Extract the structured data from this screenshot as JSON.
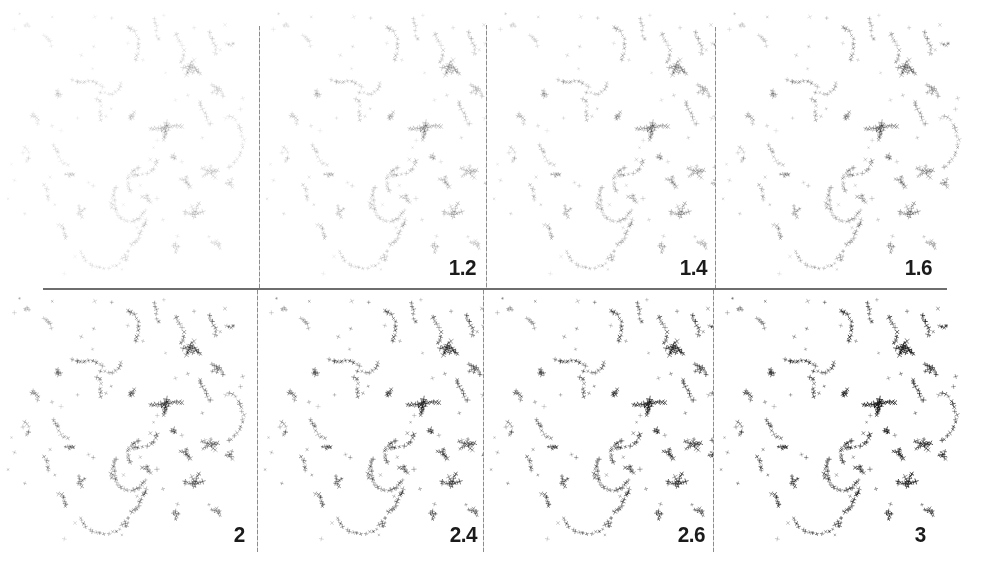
{
  "figure": {
    "type": "scanned-halftone-panel-grid",
    "rows": 2,
    "cols": 4
  },
  "panels": [
    {
      "label": "",
      "value": 1.0,
      "intensity": 0.14
    },
    {
      "label": "1.2",
      "value": 1.2,
      "intensity": 0.21
    },
    {
      "label": "1.4",
      "value": 1.4,
      "intensity": 0.28
    },
    {
      "label": "1.6",
      "value": 1.6,
      "intensity": 0.35
    },
    {
      "label": "2",
      "value": 2.0,
      "intensity": 0.48
    },
    {
      "label": "2.4",
      "value": 2.4,
      "intensity": 0.6
    },
    {
      "label": "2.6",
      "value": 2.6,
      "intensity": 0.68
    },
    {
      "label": "3",
      "value": 3.0,
      "intensity": 0.82
    }
  ],
  "colors": {
    "background": "#ffffff",
    "ink": "#161616",
    "label": "#1b1b1b",
    "column_divider": "#8c8c8c",
    "row_divider": "#6e6e6e"
  }
}
